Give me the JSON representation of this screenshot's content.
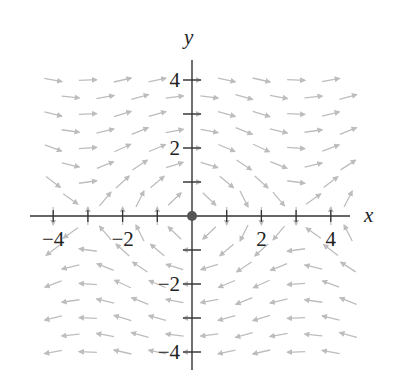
{
  "chart_data": {
    "type": "vector_field",
    "title": "",
    "xlabel": "x",
    "ylabel": "y",
    "field": {
      "formula": "F(x, y) = <y, -sin x>",
      "normalized_arrows": true
    },
    "xlim": [
      -4.5,
      4.5
    ],
    "ylim": [
      -4.5,
      4.5
    ],
    "x_ticks": [
      -4,
      -3,
      -2,
      -1,
      1,
      2,
      3,
      4
    ],
    "y_ticks": [
      -4,
      -3,
      -2,
      -1,
      1,
      2,
      3,
      4
    ],
    "x_tick_labels": [
      {
        "value": -4,
        "label": "−4"
      },
      {
        "value": -2,
        "label": "−2"
      },
      {
        "value": 2,
        "label": "2"
      },
      {
        "value": 4,
        "label": "4"
      }
    ],
    "y_tick_labels": [
      {
        "value": 4,
        "label": "4"
      },
      {
        "value": 2,
        "label": "2"
      },
      {
        "value": -2,
        "label": "−2"
      },
      {
        "value": -4,
        "label": "−4"
      }
    ],
    "grid": false,
    "equilibrium_point": {
      "x": 0,
      "y": 0
    },
    "sample_grid": {
      "rows_y_step": 0.5,
      "y_from": -4.0,
      "y_to": 4.0,
      "even_row_x": [
        -4,
        -3,
        -2,
        -1,
        0,
        1,
        2,
        3,
        4
      ],
      "odd_row_x": [
        -3.5,
        -2.5,
        -1.5,
        -0.5,
        0.5,
        1.5,
        2.5,
        3.5,
        4.5
      ]
    },
    "sample_vectors_on_x_axis": [
      {
        "x": -4,
        "direction": "down"
      },
      {
        "x": -3,
        "direction": "up"
      },
      {
        "x": -2,
        "direction": "up"
      },
      {
        "x": -1,
        "direction": "up"
      },
      {
        "x": 1,
        "direction": "down"
      },
      {
        "x": 2,
        "direction": "down"
      },
      {
        "x": 3,
        "direction": "down"
      },
      {
        "x": 4,
        "direction": "up"
      }
    ]
  },
  "style": {
    "arrow_color": "#bdbdbd",
    "axis_color": "#333333",
    "point_color": "#555555",
    "arrow_length_px": 18
  }
}
